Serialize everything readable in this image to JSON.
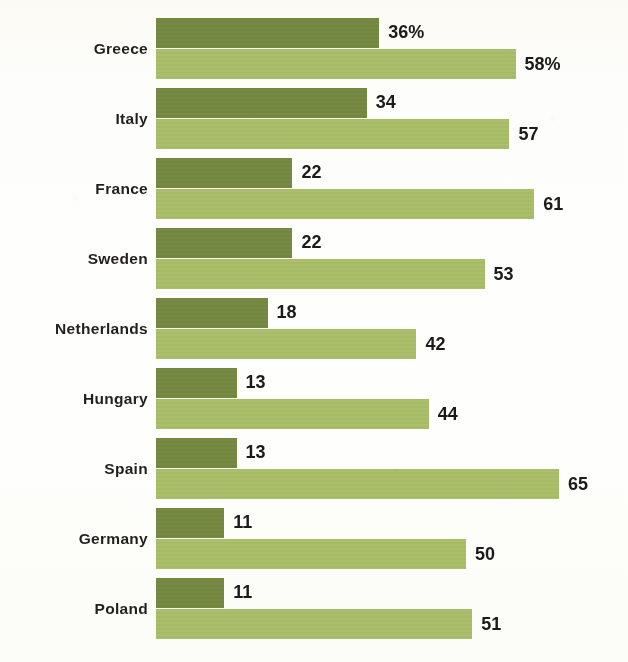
{
  "chart_data": {
    "type": "bar",
    "orientation": "horizontal",
    "title": "",
    "xlabel": "",
    "ylabel": "",
    "xlim": [
      0,
      70
    ],
    "grid": false,
    "legend": null,
    "value_suffix_first_row": "%",
    "categories": [
      "Greece",
      "Italy",
      "France",
      "Sweden",
      "Netherlands",
      "Hungary",
      "Spain",
      "Germany",
      "Poland"
    ],
    "series": [
      {
        "name": "series-dark",
        "color": "#74883F",
        "values": [
          36,
          34,
          22,
          22,
          18,
          13,
          13,
          11,
          11
        ],
        "labels": [
          "36%",
          "34",
          "22",
          "22",
          "18",
          "13",
          "13",
          "11",
          "11"
        ]
      },
      {
        "name": "series-light",
        "color": "#A9BD66",
        "values": [
          58,
          57,
          61,
          53,
          42,
          44,
          65,
          50,
          51
        ],
        "labels": [
          "58%",
          "57",
          "61",
          "53",
          "42",
          "44",
          "65",
          "50",
          "51"
        ]
      }
    ],
    "rows": [
      {
        "label": "Greece",
        "a": 36,
        "a_label": "36%",
        "b": 58,
        "b_label": "58%"
      },
      {
        "label": "Italy",
        "a": 34,
        "a_label": "34",
        "b": 57,
        "b_label": "57"
      },
      {
        "label": "France",
        "a": 22,
        "a_label": "22",
        "b": 61,
        "b_label": "61"
      },
      {
        "label": "Sweden",
        "a": 22,
        "a_label": "22",
        "b": 53,
        "b_label": "53"
      },
      {
        "label": "Netherlands",
        "a": 18,
        "a_label": "18",
        "b": 42,
        "b_label": "42"
      },
      {
        "label": "Hungary",
        "a": 13,
        "a_label": "13",
        "b": 44,
        "b_label": "44"
      },
      {
        "label": "Spain",
        "a": 13,
        "a_label": "13",
        "b": 65,
        "b_label": "65"
      },
      {
        "label": "Germany",
        "a": 11,
        "a_label": "11",
        "b": 50,
        "b_label": "50"
      },
      {
        "label": "Poland",
        "a": 11,
        "a_label": "11",
        "b": 51,
        "b_label": "51"
      }
    ]
  },
  "layout": {
    "bar_origin_x": 156,
    "px_per_unit": 6.2,
    "row_pitch": 70,
    "bar_height": 30
  }
}
